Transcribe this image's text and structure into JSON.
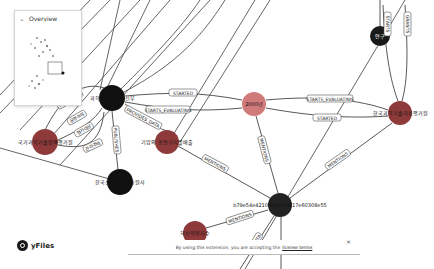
{
  "overview": {
    "title": "Overview",
    "collapse_icon": "chevron-down-icon"
  },
  "branding": {
    "name": "yFiles",
    "logo_icon": "yfiles-logo-icon"
  },
  "license": {
    "text": "By using this extension, you are accepting the",
    "link": "license terms",
    "close": "×"
  },
  "colors": {
    "node_black": "#1a1a1a",
    "node_red": "#8e3a3a",
    "node_salmon": "#d07a7a",
    "edge": "#444444",
    "label_border": "#555555"
  },
  "nodes": [
    {
      "id": "n1",
      "label": "과학기술정보통신부",
      "x": 112,
      "y": 98,
      "r": 13,
      "color": "#111111"
    },
    {
      "id": "n2",
      "label": "국가과학기술정책평가원",
      "x": 45,
      "y": 142,
      "r": 13,
      "color": "#8e3a3a"
    },
    {
      "id": "n3",
      "label": "기업의 조연구지를배출",
      "x": 167,
      "y": 142,
      "r": 12,
      "color": "#8e3a3a"
    },
    {
      "id": "n4",
      "label": "한국산업기술진흥원사",
      "x": 120,
      "y": 182,
      "r": 13,
      "color": "#111111"
    },
    {
      "id": "n5",
      "label": "2000년",
      "x": 254,
      "y": 104,
      "r": 12,
      "color": "#d07a7a"
    },
    {
      "id": "n6",
      "label": "한국과학기술기획평가원",
      "x": 400,
      "y": 113,
      "r": 12,
      "color": "#8e3a3a"
    },
    {
      "id": "n7",
      "label": "연구",
      "x": 380,
      "y": 36,
      "r": 10,
      "color": "#1a1a1a"
    },
    {
      "id": "n8",
      "label": "b79e54e4210f34487b217e60308e55",
      "x": 280,
      "y": 205,
      "r": 12,
      "color": "#222222"
    },
    {
      "id": "n9",
      "label": "혁신역량지수",
      "x": 195,
      "y": 233,
      "r": 12,
      "color": "#8e3a3a"
    }
  ],
  "edges": [
    {
      "from": "n1",
      "to": "n5",
      "label": "STARTED"
    },
    {
      "from": "n1",
      "to": "n5",
      "label": "STARTS_EVALUATING"
    },
    {
      "from": "n1",
      "to": "n3",
      "label": "PROVIDES_DATA"
    },
    {
      "from": "n1",
      "to": "n2",
      "label": "PUBLISHES"
    },
    {
      "from": "n1",
      "to": "n4",
      "label": "PUBLISHES"
    },
    {
      "from": "n2",
      "to": "n1",
      "label": "운영주체"
    },
    {
      "from": "n2",
      "to": "n1",
      "label": "평가대상"
    },
    {
      "from": "n2",
      "to": "n4",
      "label": "관리주체"
    },
    {
      "from": "n5",
      "to": "n6",
      "label": "STARTS_EVALUATING"
    },
    {
      "from": "n5",
      "to": "n6",
      "label": "STARTED"
    },
    {
      "from": "n5",
      "to": "n8",
      "label": "MENTIONS"
    },
    {
      "from": "n3",
      "to": "n8",
      "label": "MENTIONS"
    },
    {
      "from": "n6",
      "to": "n8",
      "label": "MENTIONS"
    },
    {
      "from": "n6",
      "to": "n7",
      "label": "STARTS"
    },
    {
      "from": "n6",
      "to": "n7",
      "label": "GRANTS"
    },
    {
      "from": "n8",
      "to": "n9",
      "label": "MENTIONS"
    },
    {
      "from": "n8",
      "to": "n9",
      "label": "DATA"
    },
    {
      "from": "n8",
      "to": "n4",
      "label": "MENTIONS"
    }
  ]
}
